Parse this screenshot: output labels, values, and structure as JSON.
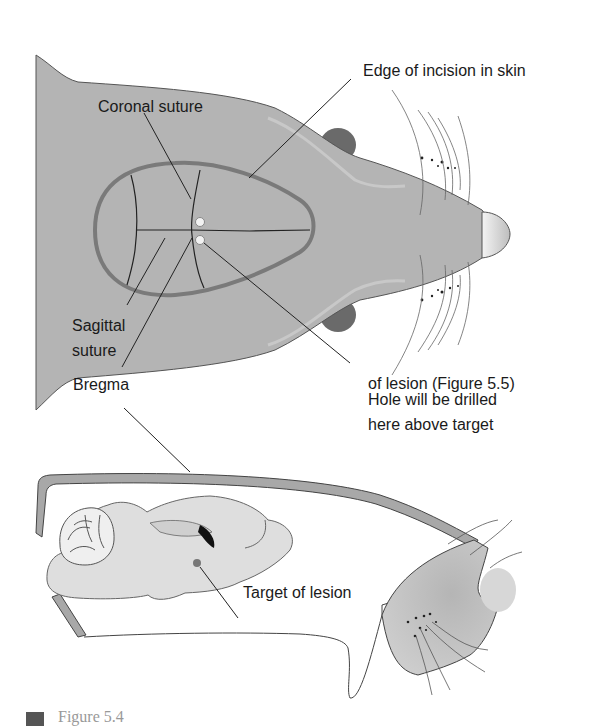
{
  "figure": {
    "top_view": {
      "labels": {
        "incision": "Edge of incision in skin",
        "coronal": "Coronal suture",
        "sagittal_line1": "Sagittal",
        "sagittal_line2": "suture",
        "hole_line1": "Hole will be drilled",
        "hole_line2": "here above target",
        "hole_line3": "of lesion (Figure 5.5)",
        "bregma": "Bregma"
      }
    },
    "side_view": {
      "labels": {
        "target": "Target of lesion"
      }
    },
    "caption": {
      "text": "Figure 5.4"
    },
    "colors": {
      "skin": "#b4b4b4",
      "incision_outline": "#7a7a7a",
      "ear": "#6a6a6a",
      "brain": "#dedede",
      "skull": "#a8a8a8",
      "nose": "#e6e6e6",
      "text": "#1a1a1a"
    }
  }
}
